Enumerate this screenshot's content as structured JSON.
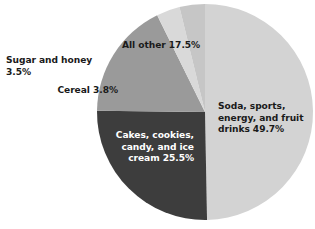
{
  "chart_data": {
    "type": "pie",
    "title": "",
    "subtitle": "",
    "xlabel": "",
    "ylabel": "",
    "grid": false,
    "legend_position": "none",
    "label_format": "name percent",
    "start_angle_deg": 0,
    "direction": "clockwise",
    "center": {
      "x": 205,
      "y": 112
    },
    "radius": 108,
    "background_color": "#ffffff",
    "categories": [
      "Soda, sports, energy, and fruit drinks",
      "Cakes, cookies, candy, and ice cream",
      "All other",
      "Sugar and honey",
      "Cereal"
    ],
    "values": [
      49.7,
      25.5,
      17.5,
      3.5,
      3.8
    ],
    "slices": [
      {
        "name": "Soda, sports, energy, and fruit drinks",
        "value": 49.7,
        "percent_text": "49.7%",
        "label_text": "Soda, sports,\nenergy, and fruit\ndrinks 49.7%",
        "color": "#d3d3d3",
        "text_color": "#1a1a1a",
        "label_placement": "inside"
      },
      {
        "name": "Cakes, cookies, candy, and ice cream",
        "value": 25.5,
        "percent_text": "25.5%",
        "label_text": "Cakes, cookies,\ncandy, and ice\ncream 25.5%",
        "color": "#3d3d3d",
        "text_color": "#ffffff",
        "label_placement": "inside"
      },
      {
        "name": "All other",
        "value": 17.5,
        "percent_text": "17.5%",
        "label_text": "All other 17.5%",
        "color": "#9a9a9a",
        "text_color": "#1a1a1a",
        "label_placement": "inside"
      },
      {
        "name": "Sugar and honey",
        "value": 3.5,
        "percent_text": "3.5%",
        "label_text": "Sugar and honey 3.5%",
        "color": "#d9d9d9",
        "text_color": "#1a1a1a",
        "label_placement": "outside"
      },
      {
        "name": "Cereal",
        "value": 3.8,
        "percent_text": "3.8%",
        "label_text": "Cereal 3.8%",
        "color": "#c6c6c6",
        "text_color": "#1a1a1a",
        "label_placement": "outside"
      }
    ]
  }
}
